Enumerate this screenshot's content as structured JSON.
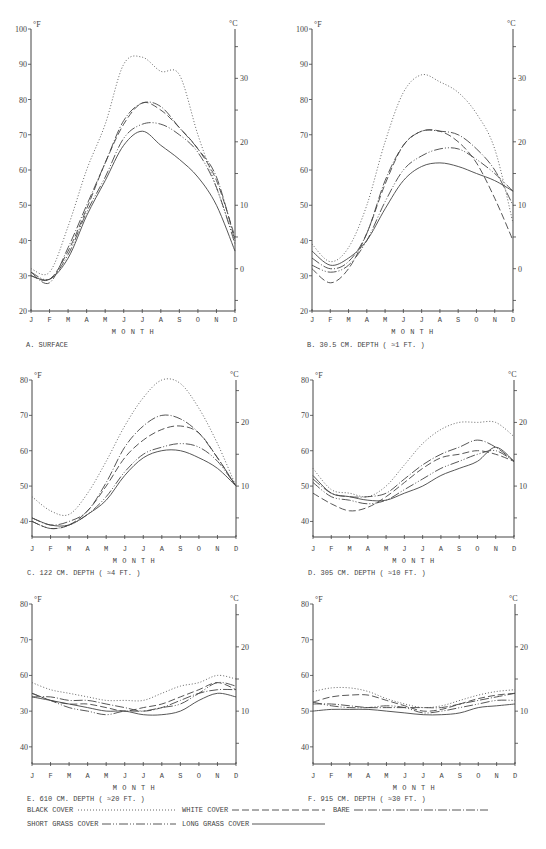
{
  "figure": {
    "months": [
      "J",
      "F",
      "M",
      "A",
      "M",
      "J",
      "J",
      "A",
      "S",
      "O",
      "N",
      "D"
    ],
    "xlabel": "MONTH",
    "unit_left": "°F",
    "unit_right": "°C"
  },
  "styles": {
    "black_cover": {
      "label": "BLACK COVER",
      "dash": "1,2",
      "width": 0.9,
      "color": "#555555"
    },
    "white_cover": {
      "label": "WHITE COVER",
      "dash": "7,3",
      "width": 0.9,
      "color": "#444444"
    },
    "bare": {
      "label": "BARE",
      "dash": "9,2,1,2",
      "width": 0.9,
      "color": "#444444"
    },
    "short_grass_cover": {
      "label": "SHORT GRASS COVER",
      "dash": "9,2,1,2,1,2",
      "width": 0.9,
      "color": "#444444"
    },
    "long_grass_cover": {
      "label": "LONG GRASS COVER",
      "dash": "",
      "width": 0.9,
      "color": "#444444"
    }
  },
  "legend": {
    "items": [
      {
        "key": "black_cover",
        "label": "BLACK COVER",
        "x": 27,
        "y": 812,
        "line_x1": 78,
        "line_x2": 176
      },
      {
        "key": "white_cover",
        "label": "WHITE COVER",
        "x": 182,
        "y": 812,
        "line_x1": 232,
        "line_x2": 325
      },
      {
        "key": "bare",
        "label": "BARE",
        "x": 333,
        "y": 812,
        "line_x1": 354,
        "line_x2": 488
      },
      {
        "key": "short_grass_cover",
        "label": "SHORT GRASS COVER",
        "x": 27,
        "y": 826,
        "line_x1": 102,
        "line_x2": 176
      },
      {
        "key": "long_grass_cover",
        "label": "LONG GRASS COVER",
        "x": 182,
        "y": 826,
        "line_x1": 252,
        "line_x2": 325
      }
    ]
  },
  "chart_data": [
    {
      "id": "A",
      "type": "line",
      "title": "A. SURFACE",
      "xlabel": "MONTH",
      "ylabel": "°F",
      "ylabel_right": "°C",
      "categories": [
        "J",
        "F",
        "M",
        "A",
        "M",
        "J",
        "J",
        "A",
        "S",
        "O",
        "N",
        "D"
      ],
      "ylim": [
        20,
        100
      ],
      "yticks": [
        20,
        30,
        40,
        50,
        60,
        70,
        80,
        90,
        100
      ],
      "yticks_right": [
        0,
        10,
        20,
        30
      ],
      "layout": {
        "x0": 31,
        "x1": 235,
        "y_top": 29,
        "y_bottom": 311,
        "ymin": 20,
        "ymax": 100,
        "caption_y": 347,
        "month_y": 322,
        "xlabel_y": 334,
        "right_ticks_c": [
          -5,
          0,
          5,
          10,
          15,
          20,
          25,
          30,
          35
        ]
      },
      "series": [
        {
          "key": "black_cover",
          "name": "Black cover",
          "values": [
            32,
            31,
            44,
            60,
            73,
            90,
            92,
            88,
            87,
            70,
            55,
            40
          ]
        },
        {
          "key": "white_cover",
          "name": "White cover",
          "values": [
            30,
            29,
            37,
            49,
            62,
            73,
            79,
            77,
            72,
            66,
            57,
            41
          ]
        },
        {
          "key": "bare",
          "name": "Bare",
          "values": [
            31,
            28,
            38,
            50,
            62,
            74,
            79,
            78,
            72,
            66,
            58,
            40
          ]
        },
        {
          "key": "short_grass_cover",
          "name": "Short grass cover",
          "values": [
            31,
            29,
            36,
            48,
            58,
            69,
            73,
            73,
            70,
            65,
            55,
            39
          ]
        },
        {
          "key": "long_grass_cover",
          "name": "Long grass cover",
          "values": [
            30,
            29,
            35,
            47,
            57,
            67,
            71,
            67,
            63,
            58,
            50,
            37
          ]
        }
      ]
    },
    {
      "id": "B",
      "type": "line",
      "title": "B. 30.5 CM. DEPTH ( ≈1 FT. )",
      "xlabel": "MONTH",
      "ylabel": "°F",
      "ylabel_right": "°C",
      "categories": [
        "J",
        "F",
        "M",
        "A",
        "M",
        "J",
        "J",
        "A",
        "S",
        "O",
        "N",
        "D"
      ],
      "ylim": [
        20,
        100
      ],
      "yticks": [
        20,
        30,
        40,
        50,
        60,
        70,
        80,
        90,
        100
      ],
      "yticks_right": [
        0,
        10,
        20,
        30
      ],
      "layout": {
        "x0": 312,
        "x1": 513,
        "y_top": 29,
        "y_bottom": 311,
        "ymin": 20,
        "ymax": 100,
        "caption_y": 347,
        "month_y": 322,
        "xlabel_y": 334,
        "right_ticks_c": [
          -5,
          0,
          5,
          10,
          15,
          20,
          25,
          30,
          35
        ]
      },
      "series": [
        {
          "key": "black_cover",
          "name": "Black cover",
          "values": [
            39,
            34,
            38,
            50,
            68,
            82,
            87,
            85,
            82,
            76,
            66,
            45
          ]
        },
        {
          "key": "white_cover",
          "name": "White cover",
          "values": [
            32,
            28,
            32,
            42,
            56,
            67,
            71,
            71,
            68,
            62,
            52,
            40
          ]
        },
        {
          "key": "bare",
          "name": "Bare",
          "values": [
            35,
            32,
            34,
            42,
            57,
            67,
            71,
            71,
            70,
            66,
            60,
            50
          ]
        },
        {
          "key": "short_grass_cover",
          "name": "Short grass cover",
          "values": [
            33,
            31,
            33,
            40,
            51,
            60,
            64,
            66,
            66,
            63,
            59,
            54
          ]
        },
        {
          "key": "long_grass_cover",
          "name": "Long grass cover",
          "values": [
            37,
            33,
            35,
            40,
            49,
            57,
            61,
            62,
            61,
            59,
            57,
            54
          ]
        }
      ]
    },
    {
      "id": "C",
      "type": "line",
      "title": "C. 122 CM. DEPTH ( ≈4 FT. )",
      "xlabel": "MONTH",
      "ylabel": "°F",
      "ylabel_right": "°C",
      "categories": [
        "J",
        "F",
        "M",
        "A",
        "M",
        "J",
        "J",
        "A",
        "S",
        "O",
        "N",
        "D"
      ],
      "ylim": [
        35,
        80
      ],
      "yticks": [
        40,
        50,
        60,
        70,
        80
      ],
      "yticks_right": [
        10,
        20
      ],
      "layout": {
        "x0": 32,
        "x1": 236,
        "y_top": 380,
        "y_bottom": 537,
        "ymin": 35.6,
        "ymax": 80,
        "caption_y": 575,
        "month_y": 551,
        "xlabel_y": 563,
        "right_ticks_c": [
          5,
          10,
          15,
          20,
          25
        ]
      },
      "series": [
        {
          "key": "black_cover",
          "name": "Black cover",
          "values": [
            47,
            43,
            42,
            48,
            57,
            67,
            75,
            80,
            79,
            72,
            62,
            50
          ]
        },
        {
          "key": "white_cover",
          "name": "White cover",
          "values": [
            40,
            38,
            39,
            43,
            50,
            58,
            63,
            66,
            67,
            65,
            58,
            50
          ]
        },
        {
          "key": "bare",
          "name": "Bare",
          "values": [
            41,
            39,
            40,
            43,
            51,
            61,
            67,
            70,
            69,
            65,
            58,
            50
          ]
        },
        {
          "key": "short_grass_cover",
          "name": "Short grass cover",
          "values": [
            40,
            38,
            39,
            42,
            47,
            54,
            59,
            61,
            62,
            61,
            57,
            50
          ]
        },
        {
          "key": "long_grass_cover",
          "name": "Long grass cover",
          "values": [
            41,
            39,
            39,
            42,
            46,
            53,
            58,
            60,
            60,
            58,
            55,
            50
          ]
        }
      ]
    },
    {
      "id": "D",
      "type": "line",
      "title": "D. 305 CM. DEPTH ( ≈10 FT. )",
      "xlabel": "MONTH",
      "ylabel": "°F",
      "ylabel_right": "°C",
      "categories": [
        "J",
        "F",
        "M",
        "A",
        "M",
        "J",
        "J",
        "A",
        "S",
        "O",
        "N",
        "D"
      ],
      "ylim": [
        35,
        80
      ],
      "yticks": [
        40,
        50,
        60,
        70,
        80
      ],
      "yticks_right": [
        10,
        20
      ],
      "layout": {
        "x0": 313,
        "x1": 514,
        "y_top": 380,
        "y_bottom": 537,
        "ymin": 35.6,
        "ymax": 80,
        "caption_y": 575,
        "month_y": 551,
        "xlabel_y": 563,
        "right_ticks_c": [
          5,
          10,
          15,
          20,
          25
        ]
      },
      "series": [
        {
          "key": "black_cover",
          "name": "Black cover",
          "values": [
            55,
            49,
            48,
            47,
            50,
            56,
            62,
            66,
            68,
            68,
            68,
            64
          ]
        },
        {
          "key": "white_cover",
          "name": "White cover",
          "values": [
            48,
            45,
            43,
            44,
            47,
            51,
            55,
            58,
            59,
            60,
            59,
            57
          ]
        },
        {
          "key": "bare",
          "name": "Bare",
          "values": [
            52,
            48,
            47,
            47,
            48,
            52,
            56,
            59,
            61,
            63,
            61,
            57
          ]
        },
        {
          "key": "short_grass_cover",
          "name": "Short grass cover",
          "values": [
            51,
            47,
            46,
            45,
            46,
            49,
            52,
            55,
            57,
            59,
            60,
            57
          ]
        },
        {
          "key": "long_grass_cover",
          "name": "Long grass cover",
          "values": [
            53,
            48,
            47,
            46,
            46,
            48,
            50,
            53,
            55,
            57,
            61,
            57
          ]
        }
      ]
    },
    {
      "id": "E",
      "type": "line",
      "title": "E. 610 CM. DEPTH ( ≈20 FT. )",
      "xlabel": "MONTH",
      "ylabel": "°F",
      "ylabel_right": "°C",
      "categories": [
        "J",
        "F",
        "M",
        "A",
        "M",
        "J",
        "J",
        "A",
        "S",
        "O",
        "N",
        "D"
      ],
      "ylim": [
        35,
        80
      ],
      "yticks": [
        40,
        50,
        60,
        70,
        80
      ],
      "ytick_labels": [
        "40",
        "30",
        "60",
        "70",
        "80"
      ],
      "yticks_right": [
        10,
        20
      ],
      "layout": {
        "x0": 32,
        "x1": 236,
        "y_top": 604,
        "y_bottom": 764,
        "ymin": 35.2,
        "ymax": 80,
        "caption_y": 801,
        "month_y": 778,
        "xlabel_y": 790,
        "right_ticks_c": [
          5,
          10,
          15,
          20,
          25
        ]
      },
      "series": [
        {
          "key": "black_cover",
          "name": "Black cover",
          "values": [
            58,
            56,
            55,
            54,
            53,
            53,
            53,
            55,
            57,
            58,
            60,
            59
          ]
        },
        {
          "key": "white_cover",
          "name": "White cover",
          "values": [
            55,
            53,
            52,
            52,
            51,
            50,
            51,
            52,
            54,
            56,
            58,
            56
          ]
        },
        {
          "key": "bare",
          "name": "Bare",
          "values": [
            54,
            54,
            53,
            53,
            52,
            51,
            50,
            51,
            53,
            55,
            56,
            56
          ]
        },
        {
          "key": "short_grass_cover",
          "name": "Short grass cover",
          "values": [
            55,
            53,
            51,
            50,
            49,
            50,
            50,
            51,
            52,
            55,
            58,
            57
          ]
        },
        {
          "key": "long_grass_cover",
          "name": "Long grass cover",
          "values": [
            54,
            53,
            52,
            51,
            50,
            50,
            49,
            49,
            50,
            53,
            55,
            54
          ]
        }
      ]
    },
    {
      "id": "F",
      "type": "line",
      "title": "F. 915 CM. DEPTH ( ≈30 FT. )",
      "xlabel": "MONTH",
      "ylabel": "°F",
      "ylabel_right": "°C",
      "categories": [
        "J",
        "F",
        "M",
        "A",
        "M",
        "J",
        "J",
        "A",
        "S",
        "O",
        "N",
        "D"
      ],
      "ylim": [
        35,
        80
      ],
      "yticks": [
        40,
        50,
        60,
        70,
        80
      ],
      "yticks_right": [
        10,
        20
      ],
      "layout": {
        "x0": 313,
        "x1": 515,
        "y_top": 604,
        "y_bottom": 764,
        "ymin": 35.2,
        "ymax": 80,
        "caption_y": 801,
        "month_y": 778,
        "xlabel_y": 790,
        "right_ticks_c": [
          5,
          10,
          15,
          20,
          25
        ]
      },
      "series": [
        {
          "key": "black_cover",
          "name": "Black cover",
          "values": [
            55.5,
            56.5,
            56.5,
            55.5,
            53.5,
            52,
            51,
            51.5,
            53,
            54.5,
            55.5,
            56
          ]
        },
        {
          "key": "white_cover",
          "name": "White cover",
          "values": [
            52.5,
            54,
            54.5,
            54.5,
            53,
            51.5,
            50,
            50.5,
            52,
            53.5,
            54.5,
            55
          ]
        },
        {
          "key": "bare",
          "name": "Bare",
          "values": [
            52,
            52,
            51.5,
            51,
            51,
            51,
            51,
            51,
            52,
            53,
            54,
            55
          ]
        },
        {
          "key": "short_grass_cover",
          "name": "Short grass cover",
          "values": [
            52.5,
            51.5,
            51,
            51,
            51.5,
            51,
            49.5,
            50,
            51,
            52,
            53,
            53
          ]
        },
        {
          "key": "long_grass_cover",
          "name": "Long grass cover",
          "values": [
            50,
            50.5,
            50.5,
            50.5,
            50,
            49.5,
            49,
            49,
            49.5,
            51,
            51.5,
            52
          ]
        }
      ]
    }
  ]
}
